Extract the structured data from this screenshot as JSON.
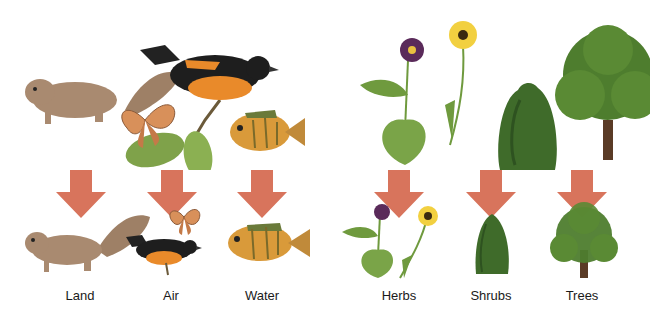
{
  "diagram": {
    "title": "",
    "groups": [
      {
        "name": "animals",
        "top_illustration": [
          "squirrel",
          "bird",
          "butterfly",
          "fish",
          "leafy branch"
        ],
        "categories": [
          {
            "label": "Land",
            "example": "squirrel"
          },
          {
            "label": "Air",
            "example": "bird and butterfly"
          },
          {
            "label": "Water",
            "example": "fish"
          }
        ]
      },
      {
        "name": "plants",
        "top_illustration": [
          "violet",
          "daisy",
          "shrub",
          "tree"
        ],
        "categories": [
          {
            "label": "Herbs",
            "example": "violet and daisy"
          },
          {
            "label": "Shrubs",
            "example": "shrub"
          },
          {
            "label": "Trees",
            "example": "tree"
          }
        ]
      }
    ],
    "colors": {
      "arrow": "#d8745c",
      "leaf_green": "#6f9a3e",
      "dark_green": "#3f6b2a",
      "bird_black": "#1e1e1e",
      "bird_orange": "#e98a2a",
      "squirrel_brown": "#a98a70",
      "fish_orange": "#d99a3a",
      "butterfly": "#d8905a",
      "trunk": "#5a3b26",
      "label_text": "#1a1a1a"
    }
  }
}
